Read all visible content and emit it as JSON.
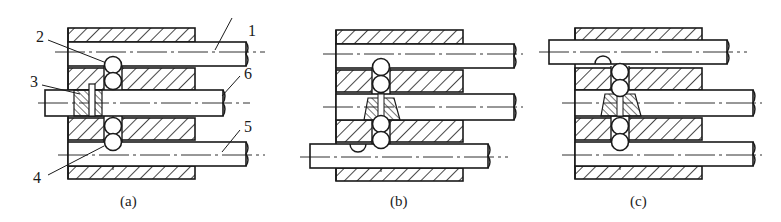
{
  "figure": {
    "panels": [
      {
        "id": "a",
        "caption": "(a)",
        "offset_x": 0,
        "state": "all rods neutral",
        "lower_rod_shift": 0,
        "upper_rod_shift": 0,
        "middle_rod_shift": 0
      },
      {
        "id": "b",
        "caption": "(b)",
        "offset_x": 268,
        "state": "bottom rod shifted left",
        "lower_rod_shift": -26,
        "upper_rod_shift": 0,
        "middle_rod_shift": 0
      },
      {
        "id": "c",
        "caption": "(c)",
        "offset_x": 507,
        "state": "top rod shifted left",
        "lower_rod_shift": 0,
        "upper_rod_shift": -26,
        "middle_rod_shift": 0
      }
    ],
    "callouts": [
      {
        "label": "1",
        "part": "upper shift rod"
      },
      {
        "label": "2",
        "part": "interlock ball (upper)"
      },
      {
        "label": "3",
        "part": "interlock pin"
      },
      {
        "label": "4",
        "part": "interlock ball (lower)"
      },
      {
        "label": "5",
        "part": "lower shift rod"
      },
      {
        "label": "6",
        "part": "middle shift rod"
      }
    ],
    "colors": {
      "line": "#1a1a1a",
      "background": "#ffffff"
    }
  }
}
